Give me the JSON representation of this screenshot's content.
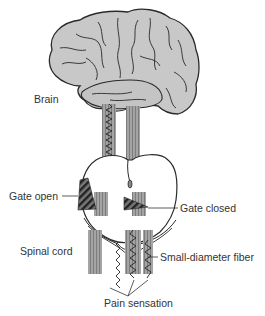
{
  "diagram": {
    "labels": {
      "brain": "Brain",
      "gate_open": "Gate open",
      "gate_closed": "Gate closed",
      "spinal_cord": "Spinal cord",
      "small_fiber": "Small-diameter fiber",
      "pain": "Pain sensation"
    },
    "colors": {
      "brain_fill": "#c8c8c8",
      "outline": "#2a2a2a",
      "fiber_fill": "#9a9a9a",
      "gate_fill": "#555555",
      "text": "#333333"
    }
  }
}
